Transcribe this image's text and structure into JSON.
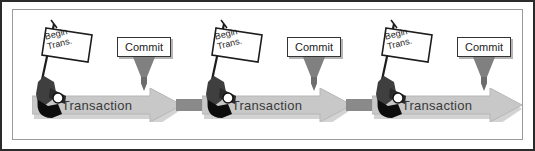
{
  "figure": {
    "background_color": "#ffffff",
    "border_color": "#2b2b2b",
    "inner_frame_color": "#9a9a9a"
  },
  "colors": {
    "arrow_fill": "#c8c8c8",
    "arrow_edge": "#b0b0b0",
    "arrow_shadow": "#a8a8a8",
    "connector": "#8a8a8a",
    "commit_triangle": "#808080",
    "pistol_dark": "#111111",
    "pistol_mid": "#4a4a4a",
    "text": "#3a3a3a",
    "box_fill": "#ffffff",
    "box_border": "#333333"
  },
  "segments": [
    {
      "index": 1,
      "x": 14,
      "transaction_label": "Transaction",
      "begin_flag": {
        "line1": "Begin",
        "line2": "Trans.",
        "icon": "starter-pistol-icon"
      },
      "commit": {
        "label": "Commit",
        "x": 117
      },
      "connector_after": true
    },
    {
      "index": 2,
      "x": 184,
      "transaction_label": "Transaction",
      "begin_flag": {
        "line1": "Begin",
        "line2": "Trans.",
        "icon": "starter-pistol-icon"
      },
      "commit": {
        "label": "Commit",
        "x": 287
      },
      "connector_after": true
    },
    {
      "index": 3,
      "x": 354,
      "transaction_label": "Transaction",
      "begin_flag": {
        "line1": "Begin",
        "line2": "Trans.",
        "icon": "starter-pistol-icon"
      },
      "commit": {
        "label": "Commit",
        "x": 457
      },
      "connector_after": false
    }
  ],
  "connectors": [
    {
      "x": 176
    },
    {
      "x": 346
    }
  ]
}
